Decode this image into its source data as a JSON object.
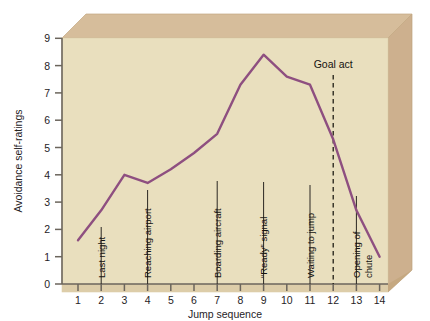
{
  "chart_data": {
    "type": "line",
    "title": "",
    "xlabel": "Jump sequence",
    "ylabel": "Avoidance self-ratings",
    "xlim": [
      1,
      14
    ],
    "ylim": [
      0,
      9.6
    ],
    "grid": false,
    "legend": "none",
    "x": [
      1,
      2,
      3,
      4,
      5,
      6,
      7,
      8,
      9,
      10,
      11,
      12,
      13,
      14
    ],
    "values": [
      1.6,
      2.7,
      4.0,
      3.7,
      4.2,
      4.8,
      5.5,
      7.3,
      8.4,
      7.6,
      7.3,
      5.3,
      2.7,
      1.0
    ],
    "series": [
      {
        "name": "Avoidance self-ratings",
        "color": "#8e4f80",
        "values": [
          1.6,
          2.7,
          4.0,
          3.7,
          4.2,
          4.8,
          5.5,
          7.3,
          8.4,
          7.6,
          7.3,
          5.3,
          2.7,
          1.0
        ]
      }
    ],
    "xticks": [
      "1",
      "2",
      "3",
      "4",
      "5",
      "6",
      "7",
      "8",
      "9",
      "10",
      "11",
      "12",
      "13",
      "14"
    ],
    "yticks": [
      "0",
      "1",
      "2",
      "3",
      "4",
      "5",
      "6",
      "7",
      "8",
      "9"
    ],
    "annotations": [
      {
        "label": "Last night",
        "x": 2
      },
      {
        "label": "Reaching airport",
        "x": 4
      },
      {
        "label": "Boarding aircraft",
        "x": 7
      },
      {
        "label": "“Ready” signal",
        "x": 9
      },
      {
        "label": "Waiting to jump",
        "x": 11
      },
      {
        "label": "Opening of",
        "x": 13
      },
      {
        "label": "chute",
        "x": 13
      }
    ],
    "marker_line": {
      "label": "Goal act",
      "x": 12,
      "style": "dashed"
    },
    "colors": {
      "plot_face": "#e8ddba",
      "slab_top": "#d4bb98",
      "slab_side": "#cfb393",
      "line": "#8e4f80",
      "axis": "#6b655c",
      "text": "#1c1a18"
    }
  }
}
